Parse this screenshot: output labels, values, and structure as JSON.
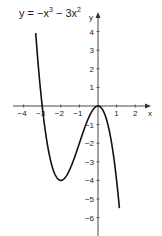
{
  "chart_data": {
    "type": "line",
    "function": "-x^3 - 3x^2",
    "xlabel": "x",
    "ylabel": "y",
    "xlim": [
      -4.5,
      2.8
    ],
    "ylim": [
      -6.9,
      5.2
    ],
    "x_ticks": [
      -4,
      -3,
      -2,
      -1,
      1,
      2
    ],
    "y_ticks": [
      4,
      3,
      2,
      1,
      -1,
      -2,
      -3,
      -4,
      -5,
      -6
    ],
    "grid": false,
    "legend": null,
    "key_points": [
      {
        "label": "root",
        "x": -3,
        "y": 0
      },
      {
        "label": "local minimum",
        "x": -2,
        "y": -4
      },
      {
        "label": "local maximum / root",
        "x": 0,
        "y": 0
      }
    ],
    "series": [
      {
        "name": "y = -x^3 - 3x^2",
        "x": [
          -3.35,
          -3.0,
          -2.5,
          -2.0,
          -1.5,
          -1.0,
          -0.5,
          0.0,
          0.5,
          1.0,
          1.15
        ],
        "y": [
          4.07,
          0.0,
          -3.13,
          -4.0,
          -3.38,
          -2.0,
          -0.63,
          0.0,
          -0.88,
          -4.0,
          -5.49
        ]
      }
    ],
    "colors": {
      "curve": "#111111",
      "axis": "#333333",
      "text": "#1a1a1a"
    }
  },
  "labels": {
    "equation_prefix": "y = −x",
    "equation_exp1": "3",
    "equation_mid": " − 3x",
    "equation_exp2": "2",
    "x_axis": "x",
    "y_axis": "y"
  }
}
